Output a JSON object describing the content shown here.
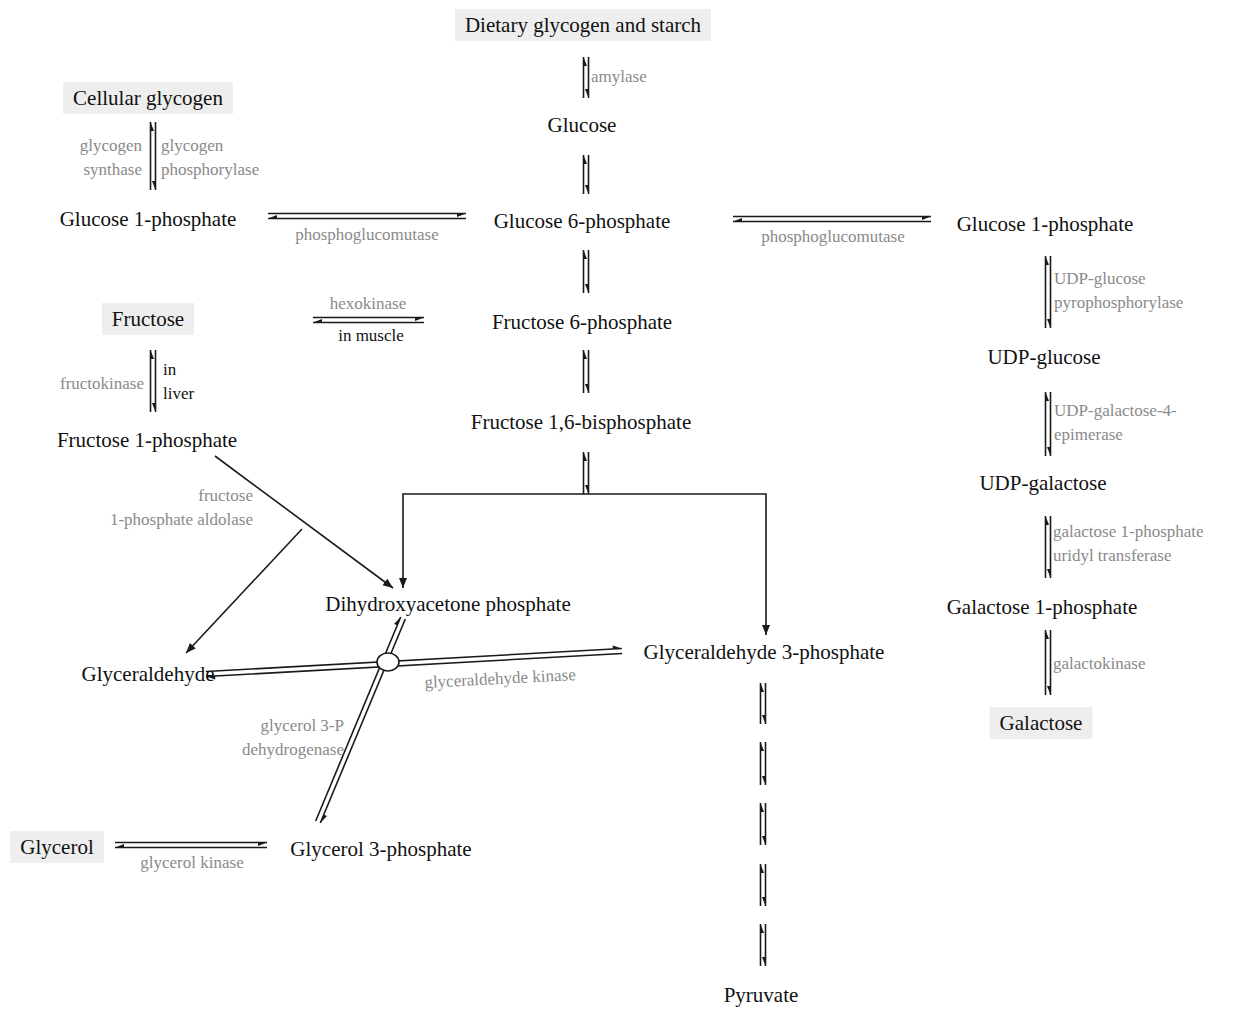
{
  "diagram": {
    "type": "metabolic-pathway",
    "colors": {
      "metabolite_text": "#111111",
      "enzyme_text": "#8a8a8a",
      "highlight_box": "#eeeeee",
      "lines": "#1a1a1a"
    },
    "metabolites": [
      {
        "id": "dietary",
        "label": "Dietary glycogen and starch",
        "x": 583,
        "y": 25,
        "highlight": true
      },
      {
        "id": "glucose",
        "label": "Glucose",
        "x": 582,
        "y": 125,
        "highlight": false
      },
      {
        "id": "cell_glycogen",
        "label": "Cellular glycogen",
        "x": 148,
        "y": 98,
        "highlight": true
      },
      {
        "id": "g1p_left",
        "label": "Glucose 1-phosphate",
        "x": 148,
        "y": 219,
        "highlight": false
      },
      {
        "id": "g6p",
        "label": "Glucose 6-phosphate",
        "x": 582,
        "y": 221,
        "highlight": false
      },
      {
        "id": "g1p_right",
        "label": "Glucose 1-phosphate",
        "x": 1045,
        "y": 224,
        "highlight": false
      },
      {
        "id": "fructose",
        "label": "Fructose",
        "x": 148,
        "y": 319,
        "highlight": true
      },
      {
        "id": "f6p",
        "label": "Fructose 6-phosphate",
        "x": 582,
        "y": 322,
        "highlight": false
      },
      {
        "id": "udp_glucose",
        "label": "UDP-glucose",
        "x": 1044,
        "y": 357,
        "highlight": false
      },
      {
        "id": "f1p",
        "label": "Fructose 1-phosphate",
        "x": 147,
        "y": 440,
        "highlight": false
      },
      {
        "id": "f16bp",
        "label": "Fructose 1,6-bisphosphate",
        "x": 581,
        "y": 422,
        "highlight": false
      },
      {
        "id": "udp_galactose",
        "label": "UDP-galactose",
        "x": 1043,
        "y": 483,
        "highlight": false
      },
      {
        "id": "dhap",
        "label": "Dihydroxyacetone phosphate",
        "x": 448,
        "y": 604,
        "highlight": false
      },
      {
        "id": "gal1p",
        "label": "Galactose 1-phosphate",
        "x": 1042,
        "y": 607,
        "highlight": false
      },
      {
        "id": "glyceraldehyde",
        "label": "Glyceraldehyde",
        "x": 148,
        "y": 674,
        "highlight": false
      },
      {
        "id": "gap",
        "label": "Glyceraldehyde 3-phosphate",
        "x": 764,
        "y": 652,
        "highlight": false
      },
      {
        "id": "galactose",
        "label": "Galactose",
        "x": 1041,
        "y": 723,
        "highlight": true
      },
      {
        "id": "glycerol",
        "label": "Glycerol",
        "x": 57,
        "y": 847,
        "highlight": true
      },
      {
        "id": "g3p",
        "label": "Glycerol 3-phosphate",
        "x": 381,
        "y": 849,
        "highlight": false
      },
      {
        "id": "pyruvate",
        "label": "Pyruvate",
        "x": 761,
        "y": 995,
        "highlight": false
      }
    ],
    "enzymes": [
      {
        "id": "amylase",
        "lines": [
          "amylase"
        ],
        "x": 591,
        "y": 76,
        "anchor": "start"
      },
      {
        "id": "glycogen_synthase",
        "lines": [
          "glycogen",
          "synthase"
        ],
        "x": 142,
        "y": 145,
        "anchor": "end"
      },
      {
        "id": "glycogen_phosphorylase",
        "lines": [
          "glycogen",
          "phosphorylase"
        ],
        "x": 161,
        "y": 145,
        "anchor": "start"
      },
      {
        "id": "pgm_left",
        "lines": [
          "phosphoglucomutase"
        ],
        "x": 367,
        "y": 234,
        "anchor": "middle"
      },
      {
        "id": "pgm_right",
        "lines": [
          "phosphoglucomutase"
        ],
        "x": 833,
        "y": 236,
        "anchor": "middle"
      },
      {
        "id": "hexokinase",
        "lines": [
          "hexokinase"
        ],
        "x": 368,
        "y": 303,
        "anchor": "middle"
      },
      {
        "id": "udp_glc_ppase",
        "lines": [
          "UDP-glucose",
          "pyrophosphorylase"
        ],
        "x": 1054,
        "y": 278,
        "anchor": "start"
      },
      {
        "id": "fructokinase",
        "lines": [
          "fructokinase"
        ],
        "x": 144,
        "y": 383,
        "anchor": "end"
      },
      {
        "id": "udp_gal_epimerase",
        "lines": [
          "UDP-galactose-4-",
          "epimerase"
        ],
        "x": 1054,
        "y": 410,
        "anchor": "start"
      },
      {
        "id": "f1p_aldolase",
        "lines": [
          "fructose",
          "1-phosphate aldolase"
        ],
        "x": 253,
        "y": 495,
        "anchor": "end"
      },
      {
        "id": "gal1p_uridyl",
        "lines": [
          "galactose 1-phosphate",
          "uridyl transferase"
        ],
        "x": 1053,
        "y": 531,
        "anchor": "start"
      },
      {
        "id": "glyceraldehyde_kinase",
        "lines": [
          "glyceraldehyde kinase"
        ],
        "x": 500,
        "y": 678,
        "anchor": "middle",
        "rotate": -3
      },
      {
        "id": "galactokinase",
        "lines": [
          "galactokinase"
        ],
        "x": 1053,
        "y": 663,
        "anchor": "start"
      },
      {
        "id": "g3p_dh",
        "lines": [
          "glycerol 3-P",
          "dehydrogenase"
        ],
        "x": 344,
        "y": 725,
        "anchor": "end"
      },
      {
        "id": "glycerol_kinase",
        "lines": [
          "glycerol kinase"
        ],
        "x": 192,
        "y": 862,
        "anchor": "middle"
      }
    ],
    "conditions": [
      {
        "id": "in_muscle",
        "lines": [
          "in muscle"
        ],
        "x": 371,
        "y": 335,
        "anchor": "middle"
      },
      {
        "id": "in_liver",
        "lines": [
          "in",
          "liver"
        ],
        "x": 163,
        "y": 369,
        "anchor": "start"
      }
    ],
    "vertical_equilibria": [
      {
        "x": 586,
        "y1": 57,
        "y2": 98
      },
      {
        "x": 153,
        "y1": 122,
        "y2": 190
      },
      {
        "x": 586,
        "y1": 155,
        "y2": 194
      },
      {
        "x": 586,
        "y1": 250,
        "y2": 293
      },
      {
        "x": 1048,
        "y1": 256,
        "y2": 328
      },
      {
        "x": 153,
        "y1": 350,
        "y2": 412
      },
      {
        "x": 586,
        "y1": 350,
        "y2": 393
      },
      {
        "x": 1048,
        "y1": 392,
        "y2": 456
      },
      {
        "x": 586,
        "y1": 452,
        "y2": 494
      },
      {
        "x": 1048,
        "y1": 516,
        "y2": 578
      },
      {
        "x": 1048,
        "y1": 630,
        "y2": 695
      },
      {
        "x": 763,
        "y1": 683,
        "y2": 724
      },
      {
        "x": 763,
        "y1": 742,
        "y2": 785
      },
      {
        "x": 763,
        "y1": 803,
        "y2": 845
      },
      {
        "x": 763,
        "y1": 864,
        "y2": 906
      },
      {
        "x": 763,
        "y1": 924,
        "y2": 966
      }
    ],
    "horizontal_equilibria": [
      {
        "x1": 268,
        "x2": 466,
        "y": 216
      },
      {
        "x1": 733,
        "x2": 931,
        "y": 219
      },
      {
        "x1": 313,
        "x2": 424,
        "y": 320
      },
      {
        "x1": 115,
        "x2": 267,
        "y": 845
      }
    ],
    "single_arrows": [
      {
        "from": [
          215,
          456
        ],
        "to": [
          393,
          588
        ],
        "note": "Fructose 1-phosphate to DHAP"
      },
      {
        "from": [
          302,
          529
        ],
        "to": [
          186,
          653
        ],
        "note": "aldolase branch to Glyceraldehyde"
      }
    ],
    "split": {
      "top_x": 586,
      "bar_y": 494,
      "left_x": 403,
      "right_x": 766,
      "left_end_y": 588,
      "right_end_y": 635
    },
    "crossing": {
      "horizontal": {
        "x1": 206,
        "y1": 674,
        "x2": 622,
        "y2": 651
      },
      "diagonal": {
        "x1": 403,
        "y1": 618,
        "x2": 318,
        "y2": 822
      },
      "junction": {
        "x": 388,
        "y": 662,
        "r": 10
      }
    }
  }
}
